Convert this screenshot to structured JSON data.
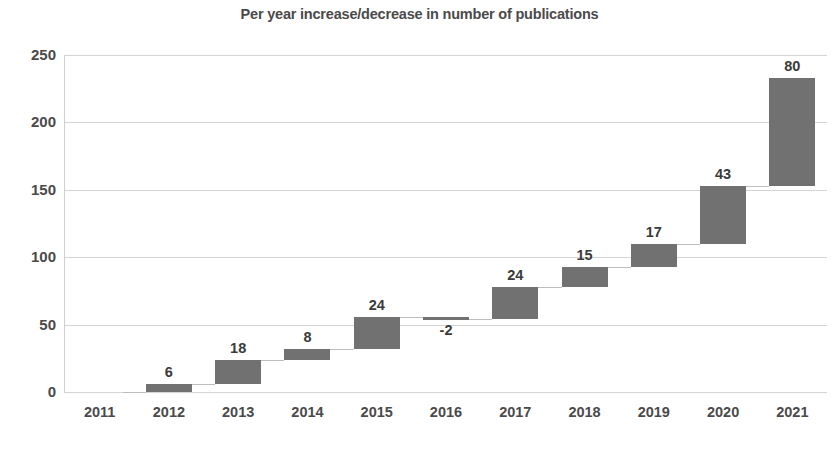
{
  "chart_data": {
    "type": "bar",
    "chart_subtype": "waterfall",
    "title": "Per year increase/decrease in number of publications",
    "xlabel": "",
    "ylabel": "",
    "categories": [
      "2011",
      "2012",
      "2013",
      "2014",
      "2015",
      "2016",
      "2017",
      "2018",
      "2019",
      "2020",
      "2021"
    ],
    "values": [
      0,
      6,
      18,
      8,
      24,
      -2,
      24,
      15,
      17,
      43,
      80
    ],
    "data_labels": [
      "",
      "6",
      "18",
      "8",
      "24",
      "-2",
      "24",
      "15",
      "17",
      "43",
      "80"
    ],
    "cumulative_start": [
      0,
      0,
      6,
      24,
      32,
      56,
      54,
      78,
      93,
      110,
      153
    ],
    "cumulative_end": [
      0,
      6,
      24,
      32,
      56,
      54,
      78,
      93,
      110,
      153,
      233
    ],
    "ylim": [
      0,
      250
    ],
    "yticks": [
      0,
      50,
      100,
      150,
      200,
      250
    ],
    "ytick_labels": [
      "0",
      "50",
      "100",
      "150",
      "200",
      "250"
    ],
    "grid": true,
    "legend": false,
    "bar_color": "#717171",
    "grid_color": "#d4d4d4",
    "text_color": "#4a4a4a",
    "background_color": "#ffffff"
  }
}
